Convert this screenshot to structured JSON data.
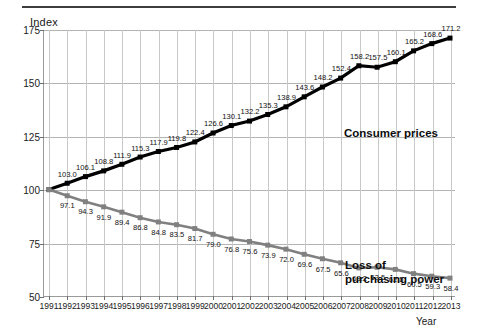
{
  "chart_data": {
    "type": "line",
    "title": "",
    "xlabel": "Year",
    "ylabel": "Index",
    "ylim": [
      50,
      175
    ],
    "yticks": [
      175,
      150,
      125,
      100,
      75,
      50
    ],
    "grid": true,
    "legend_position": "inline-annotation",
    "categories": [
      "1991",
      "1992",
      "1993",
      "1994",
      "1995",
      "1996",
      "1997",
      "1998",
      "1999",
      "2000",
      "2001",
      "2002",
      "2003",
      "2004",
      "2005",
      "2006",
      "2007",
      "2008",
      "2009",
      "2010",
      "2011",
      "2012",
      "2013"
    ],
    "series": [
      {
        "name": "Consumer prices",
        "color": "#000000",
        "values": [
          100.0,
          103.0,
          106.1,
          108.8,
          111.9,
          115.3,
          117.9,
          119.8,
          122.4,
          126.6,
          130.1,
          132.2,
          135.3,
          138.9,
          143.6,
          148.2,
          152.4,
          158.2,
          157.5,
          160.1,
          165.2,
          168.6,
          171.2
        ],
        "labels": [
          "",
          "103.0",
          "106.1",
          "108.8",
          "111.9",
          "115.3",
          "117.9",
          "119.8",
          "122.4",
          "126.6",
          "130.1",
          "132.2",
          "135.3",
          "138.9",
          "143.6",
          "148.2",
          "152.4",
          "158.2",
          "157.5",
          "160.1",
          "165.2",
          "168.6",
          "171.2"
        ]
      },
      {
        "name": "Loss of\npurchasing power",
        "color": "#808080",
        "values": [
          100.0,
          97.1,
          94.3,
          91.9,
          89.4,
          86.8,
          84.8,
          83.5,
          81.7,
          79.0,
          76.8,
          75.6,
          73.9,
          72.0,
          69.6,
          67.5,
          65.6,
          63.2,
          63.5,
          62.5,
          60.5,
          59.3,
          58.4
        ],
        "labels": [
          "",
          "97.1",
          "94.3",
          "91.9",
          "89.4",
          "86.8",
          "84.8",
          "83.5",
          "81.7",
          "79.0",
          "76.8",
          "75.6",
          "73.9",
          "72.0",
          "69.6",
          "67.5",
          "65.6",
          "63.2",
          "63.5",
          "62.5",
          "60.5",
          "59.3",
          "58.4"
        ]
      }
    ]
  }
}
